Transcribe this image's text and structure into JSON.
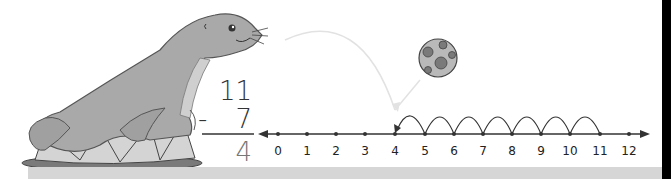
{
  "problem": {
    "minuend": "11",
    "operator": "-",
    "subtrahend": "7",
    "difference": "4"
  },
  "number_line": {
    "labels": [
      "0",
      "1",
      "2",
      "3",
      "4",
      "5",
      "6",
      "7",
      "8",
      "9",
      "10",
      "11",
      "12"
    ],
    "start_value": 11,
    "end_value": 4,
    "hops": 7,
    "hop_direction": "left"
  },
  "illustration": {
    "character": "seal on circus drum",
    "object": "spotted ball"
  },
  "colors": {
    "seal": "#a9a9a9",
    "seal_outline": "#555555",
    "drum_top": "#c8c8c8",
    "drum_side": "#d4d4d4",
    "drum_rim": "#7a7a7a",
    "ball": "#b9b9b9",
    "ball_spots": "#7a7a7a",
    "line": "#333333",
    "answer": "#777777",
    "bottom_bar": "#d6d6d6"
  }
}
